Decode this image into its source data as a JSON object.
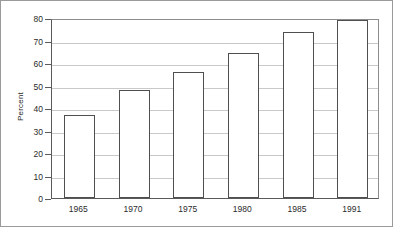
{
  "chart_data": {
    "type": "bar",
    "title": "",
    "xlabel": "",
    "ylabel": "Percent",
    "categories": [
      "1965",
      "1970",
      "1975",
      "1980",
      "1985",
      "1991"
    ],
    "values": [
      37,
      48,
      56,
      64.5,
      74,
      79
    ],
    "ylim": [
      0,
      80
    ],
    "ytick_labels": [
      "0",
      "10",
      "20",
      "30",
      "40",
      "50",
      "60",
      "70",
      "80"
    ],
    "ytick_values": [
      0,
      10,
      20,
      30,
      40,
      50,
      60,
      70,
      80
    ],
    "grid": "horizontal",
    "legend": "none",
    "bar_fill_color": "#ffffff",
    "bar_edge_color": "#4f4f4f",
    "grid_color": "#c9c9c9",
    "axis_color": "#5a5a5a",
    "frame_color": "#9a9a9a",
    "text_color": "#2b2b2b",
    "background_color": "#ffffff"
  }
}
